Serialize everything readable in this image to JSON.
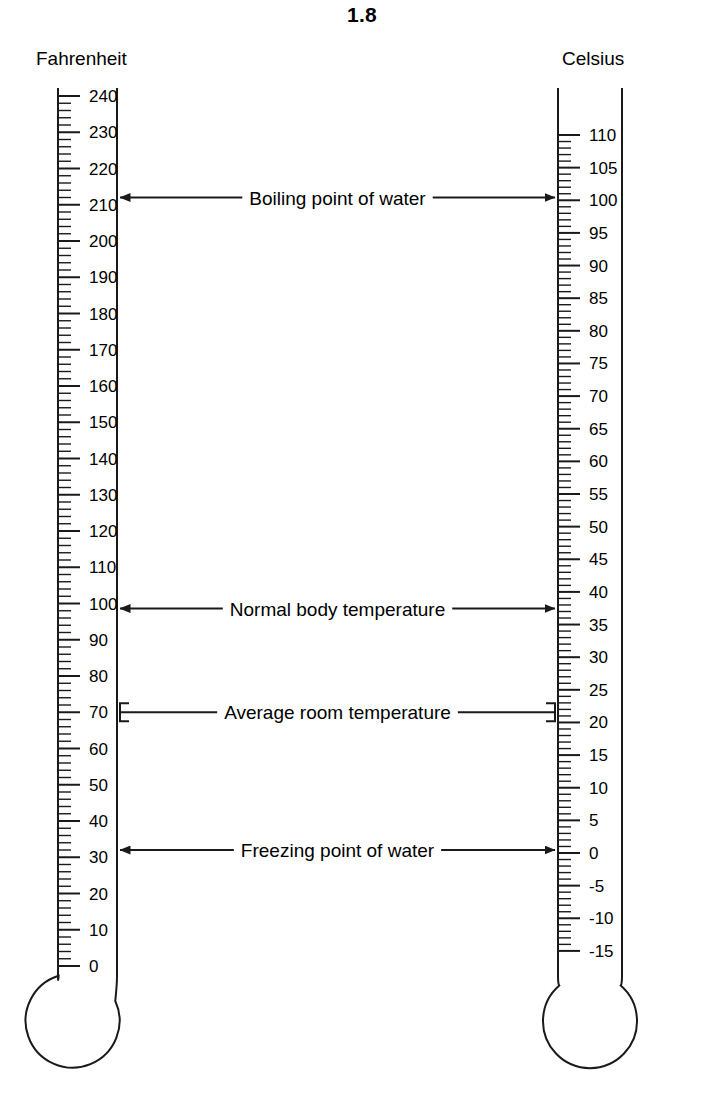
{
  "figure": {
    "number": "1.8"
  },
  "scales": {
    "fahrenheit": {
      "name": "Fahrenheit",
      "unit": "F",
      "min": 0,
      "max": 240,
      "major_step": 10,
      "minor_step": 2,
      "labels": [
        "240",
        "230",
        "220",
        "210",
        "200",
        "190",
        "180",
        "170",
        "160",
        "150",
        "140",
        "130",
        "120",
        "110",
        "100",
        "90",
        "80",
        "70",
        "60",
        "50",
        "40",
        "30",
        "20",
        "10",
        "0"
      ],
      "values": [
        240,
        230,
        220,
        210,
        200,
        190,
        180,
        170,
        160,
        150,
        140,
        130,
        120,
        110,
        100,
        90,
        80,
        70,
        60,
        50,
        40,
        30,
        20,
        10,
        0
      ]
    },
    "celsius": {
      "name": "Celsius",
      "unit": "C",
      "min": -15,
      "max": 110,
      "major_step": 5,
      "minor_step": 1,
      "labels": [
        "110",
        "105",
        "100",
        "95",
        "90",
        "85",
        "80",
        "75",
        "70",
        "65",
        "60",
        "55",
        "50",
        "45",
        "40",
        "35",
        "30",
        "25",
        "20",
        "15",
        "10",
        "5",
        "0",
        "-5",
        "-10",
        "-15"
      ],
      "values": [
        110,
        105,
        100,
        95,
        90,
        85,
        80,
        75,
        70,
        65,
        60,
        55,
        50,
        45,
        40,
        35,
        30,
        25,
        20,
        15,
        10,
        5,
        0,
        -5,
        -10,
        -15
      ]
    }
  },
  "annotations": [
    {
      "label": "Boiling point of water",
      "fahrenheit": 212,
      "celsius": 100,
      "endpoints": "arrows"
    },
    {
      "label": "Normal body temperature",
      "fahrenheit": 98.6,
      "celsius": 37,
      "endpoints": "arrows"
    },
    {
      "label": "Average room temperature",
      "fahrenheit": 70,
      "celsius": 21,
      "endpoints": "brackets"
    },
    {
      "label": "Freezing point of water",
      "fahrenheit": 32,
      "celsius": 0,
      "endpoints": "arrows"
    }
  ],
  "colors": {
    "ink": "#1a1a1a",
    "background": "#ffffff"
  }
}
